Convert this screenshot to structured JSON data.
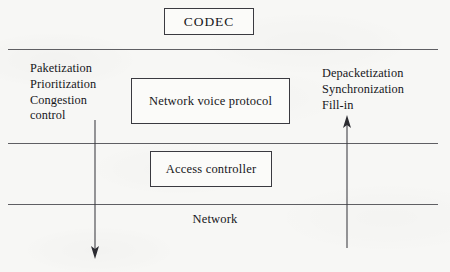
{
  "figure": {
    "background_color": "#f7f7f5",
    "ink_color": "#16161a",
    "rule_color": "#4a4a4e",
    "width": 450,
    "height": 272
  },
  "boxes": {
    "codec": {
      "label": "CODEC"
    },
    "network_voice_protocol": {
      "label": "Network voice\nprotocol"
    },
    "access_controller": {
      "label": "Access\ncontroller"
    }
  },
  "layers": {
    "network_label": "Network"
  },
  "annotations": {
    "ingress": {
      "text": "Paketization\nPrioritization\nCongestion\ncontrol",
      "lines": [
        "Paketization",
        "Prioritization",
        "Congestion",
        "control"
      ]
    },
    "egress": {
      "text": "Depacketization\nSynchronization\nFill-in",
      "lines": [
        "Depacketization",
        "Synchronization",
        "Fill-in"
      ]
    }
  },
  "arrows": [
    {
      "name": "downstream-flow-arrow",
      "direction": "down",
      "x": 95,
      "from_y": 120,
      "to_y": 258
    },
    {
      "name": "upstream-flow-arrow",
      "direction": "up",
      "x": 347,
      "from_y": 248,
      "to_y": 116
    }
  ],
  "rules": [
    {
      "name": "codec-to-protocol-rule",
      "y": 49,
      "x1": 8,
      "x2": 438
    },
    {
      "name": "protocol-to-access-rule",
      "y": 143,
      "x1": 8,
      "x2": 438
    },
    {
      "name": "access-to-network-rule",
      "y": 204,
      "x1": 8,
      "x2": 438
    }
  ]
}
